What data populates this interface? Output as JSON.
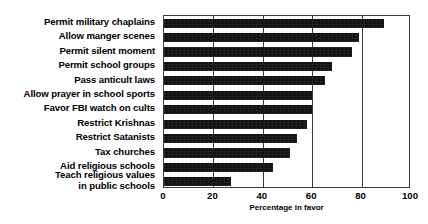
{
  "chart_data": {
    "type": "bar",
    "orientation": "horizontal",
    "title": "",
    "xlabel": "Percentage in favor",
    "ylabel": "",
    "xlim": [
      0,
      100
    ],
    "xticks": [
      0,
      20,
      40,
      60,
      80,
      100
    ],
    "grid": true,
    "legend": false,
    "bar_color": "#111111",
    "axis_color": "#3c3c3c",
    "categories": [
      "Permit military chaplains",
      "Allow manger scenes",
      "Permit silent moment",
      "Permit school groups",
      "Pass anticult laws",
      "Allow prayer in school sports",
      "Favor FBI watch on cults",
      "Restrict Krishnas",
      "Restrict Satanists",
      "Tax churches",
      "Teach religious values\nin public schools"
    ],
    "values": [
      89,
      79,
      76,
      68,
      65,
      60,
      60,
      58,
      54,
      51,
      44
    ]
  },
  "chart_data_note": "values in percent",
  "axis": {
    "ticks": [
      "0",
      "20",
      "40",
      "60",
      "80",
      "100"
    ],
    "title": "Percentage in favor"
  },
  "bars": [
    {
      "label": "Permit military chaplains",
      "value": 89
    },
    {
      "label": "Allow manger scenes",
      "value": 79
    },
    {
      "label": "Permit silent moment",
      "value": 76
    },
    {
      "label": "Permit school groups",
      "value": 68
    },
    {
      "label": "Pass anticult laws",
      "value": 65
    },
    {
      "label": "Allow prayer in school sports",
      "value": 60
    },
    {
      "label": "Favor FBI watch on cults",
      "value": 60
    },
    {
      "label": "Restrict Krishnas",
      "value": 58
    },
    {
      "label": "Restrict Satanists",
      "value": 54
    },
    {
      "label": "Tax churches",
      "value": 51
    },
    {
      "label": "Aid religious schools",
      "value": 44
    },
    {
      "label": "Teach religious values\nin public schools",
      "value": 27
    }
  ]
}
